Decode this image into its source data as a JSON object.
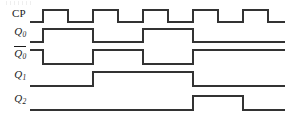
{
  "figure": {
    "type": "digital-timing-diagram",
    "width": 296,
    "height": 127,
    "background_color": "#ffffff",
    "line_color": "#333333",
    "line_width": 1.4
  },
  "axis": {
    "wave_start_x": 30,
    "wave_end_x": 285,
    "clock_period_px": 50,
    "first_rising_edge_x": 43,
    "pulse_high_width_px": 25
  },
  "signals": [
    {
      "name": "CP",
      "label_plain": "CP",
      "label_base": "",
      "label_sub": "",
      "overbar": false,
      "row_low_y": 22,
      "row_high_y": 10,
      "label_top": 8,
      "segments": [
        {
          "x": 30,
          "level": 0
        },
        {
          "x": 43,
          "level": 1
        },
        {
          "x": 68,
          "level": 0
        },
        {
          "x": 93,
          "level": 1
        },
        {
          "x": 118,
          "level": 0
        },
        {
          "x": 143,
          "level": 1
        },
        {
          "x": 168,
          "level": 0
        },
        {
          "x": 193,
          "level": 1
        },
        {
          "x": 218,
          "level": 0
        },
        {
          "x": 243,
          "level": 1
        },
        {
          "x": 268,
          "level": 0
        },
        {
          "x": 285,
          "level": 0
        }
      ]
    },
    {
      "name": "Q0",
      "label_plain": "",
      "label_base": "Q",
      "label_sub": "0",
      "overbar": false,
      "row_low_y": 42,
      "row_high_y": 29,
      "label_top": 26,
      "segments": [
        {
          "x": 30,
          "level": 0
        },
        {
          "x": 43,
          "level": 1
        },
        {
          "x": 93,
          "level": 0
        },
        {
          "x": 143,
          "level": 1
        },
        {
          "x": 193,
          "level": 0
        },
        {
          "x": 285,
          "level": 0
        }
      ]
    },
    {
      "name": "Q0bar",
      "label_plain": "",
      "label_base": "Q",
      "label_sub": "0",
      "overbar": true,
      "row_low_y": 64,
      "row_high_y": 50,
      "label_top": 46,
      "segments": [
        {
          "x": 30,
          "level": 1
        },
        {
          "x": 43,
          "level": 0
        },
        {
          "x": 93,
          "level": 1
        },
        {
          "x": 143,
          "level": 0
        },
        {
          "x": 193,
          "level": 1
        },
        {
          "x": 285,
          "level": 1
        }
      ]
    },
    {
      "name": "Q1",
      "label_plain": "",
      "label_base": "Q",
      "label_sub": "1",
      "overbar": false,
      "row_low_y": 86,
      "row_high_y": 72,
      "label_top": 69,
      "segments": [
        {
          "x": 30,
          "level": 0
        },
        {
          "x": 93,
          "level": 1
        },
        {
          "x": 193,
          "level": 0
        },
        {
          "x": 285,
          "level": 0
        }
      ]
    },
    {
      "name": "Q2",
      "label_plain": "",
      "label_base": "Q",
      "label_sub": "2",
      "overbar": false,
      "row_low_y": 110,
      "row_high_y": 96,
      "label_top": 93,
      "segments": [
        {
          "x": 30,
          "level": 0
        },
        {
          "x": 193,
          "level": 1
        },
        {
          "x": 243,
          "level": 0
        },
        {
          "x": 285,
          "level": 0
        }
      ]
    }
  ],
  "chart_data": {
    "type": "line",
    "title": "",
    "xlabel": "",
    "ylabel": "",
    "series": [
      {
        "name": "CP",
        "values": [
          0,
          1,
          0,
          1,
          0,
          1,
          0,
          1,
          0,
          1,
          0,
          0
        ]
      },
      {
        "name": "Q0",
        "values": [
          0,
          1,
          0,
          1,
          0,
          0
        ]
      },
      {
        "name": "Q0bar",
        "values": [
          1,
          0,
          1,
          0,
          1,
          1
        ]
      },
      {
        "name": "Q1",
        "values": [
          0,
          1,
          0,
          0
        ]
      },
      {
        "name": "Q2",
        "values": [
          0,
          1,
          0,
          0
        ]
      }
    ]
  }
}
